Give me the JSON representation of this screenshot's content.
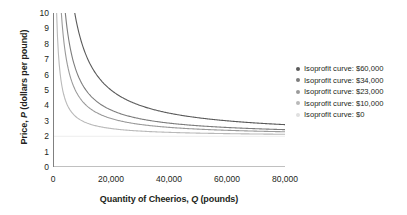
{
  "chart_data": {
    "type": "line",
    "title": "",
    "xlabel": "Quantity of Cheerios, Q (pounds)",
    "ylabel": "Price, P (dollars per pound)",
    "xlabel_parts": {
      "pre": "Quantity of Cheerios, ",
      "symbol": "Q",
      "post": " (pounds)"
    },
    "ylabel_parts": {
      "pre": "Price, ",
      "symbol": "P",
      "post": " (dollars per pound)"
    },
    "xlim": [
      0,
      80000
    ],
    "ylim": [
      0,
      10
    ],
    "xticks": [
      0,
      20000,
      40000,
      60000,
      80000
    ],
    "xtick_labels": [
      "0",
      "20,000",
      "40,000",
      "60,000",
      "80,000"
    ],
    "yticks": [
      0,
      1,
      2,
      3,
      4,
      5,
      6,
      7,
      8,
      9,
      10
    ],
    "ytick_labels": [
      "0",
      "1",
      "2",
      "3",
      "4",
      "5",
      "6",
      "7",
      "8",
      "9",
      "10"
    ],
    "grid": false,
    "legend_position": "right",
    "marginal_cost": 2,
    "curve_formula": "P = MC + profit / Q",
    "series": [
      {
        "name": "Isoprofit curve: $60,000",
        "profit": 60000,
        "color": "#5a5a5a",
        "points": [
          {
            "x": 7500,
            "y": 10.0
          },
          {
            "x": 8000,
            "y": 9.5
          },
          {
            "x": 8571,
            "y": 9.0
          },
          {
            "x": 10000,
            "y": 8.0
          },
          {
            "x": 12000,
            "y": 7.0
          },
          {
            "x": 15000,
            "y": 6.0
          },
          {
            "x": 20000,
            "y": 5.0
          },
          {
            "x": 24000,
            "y": 4.5
          },
          {
            "x": 30000,
            "y": 4.0
          },
          {
            "x": 40000,
            "y": 3.5
          },
          {
            "x": 60000,
            "y": 3.0
          },
          {
            "x": 80000,
            "y": 2.75
          }
        ]
      },
      {
        "name": "Isoprofit curve: $34,000",
        "profit": 34000,
        "color": "#7d7d7d",
        "points": [
          {
            "x": 4250,
            "y": 10.0
          },
          {
            "x": 4857,
            "y": 9.0
          },
          {
            "x": 5667,
            "y": 8.0
          },
          {
            "x": 6800,
            "y": 7.0
          },
          {
            "x": 8500,
            "y": 6.0
          },
          {
            "x": 11333,
            "y": 5.0
          },
          {
            "x": 17000,
            "y": 4.0
          },
          {
            "x": 22667,
            "y": 3.5
          },
          {
            "x": 34000,
            "y": 3.0
          },
          {
            "x": 56667,
            "y": 2.6
          },
          {
            "x": 80000,
            "y": 2.425
          }
        ]
      },
      {
        "name": "Isoprofit curve: $23,000",
        "profit": 23000,
        "color": "#9a9a9a",
        "points": [
          {
            "x": 2875,
            "y": 10.0
          },
          {
            "x": 3286,
            "y": 9.0
          },
          {
            "x": 3833,
            "y": 8.0
          },
          {
            "x": 4600,
            "y": 7.0
          },
          {
            "x": 5750,
            "y": 6.0
          },
          {
            "x": 7667,
            "y": 5.0
          },
          {
            "x": 11500,
            "y": 4.0
          },
          {
            "x": 15333,
            "y": 3.5
          },
          {
            "x": 23000,
            "y": 3.0
          },
          {
            "x": 46000,
            "y": 2.5
          },
          {
            "x": 80000,
            "y": 2.2875
          }
        ]
      },
      {
        "name": "Isoprofit curve: $10,000",
        "profit": 10000,
        "color": "#b9b9b9",
        "points": [
          {
            "x": 1250,
            "y": 10.0
          },
          {
            "x": 1429,
            "y": 9.0
          },
          {
            "x": 1667,
            "y": 8.0
          },
          {
            "x": 2000,
            "y": 7.0
          },
          {
            "x": 2500,
            "y": 6.0
          },
          {
            "x": 3333,
            "y": 5.0
          },
          {
            "x": 5000,
            "y": 4.0
          },
          {
            "x": 6667,
            "y": 3.5
          },
          {
            "x": 10000,
            "y": 3.0
          },
          {
            "x": 20000,
            "y": 2.5
          },
          {
            "x": 40000,
            "y": 2.25
          },
          {
            "x": 80000,
            "y": 2.125
          }
        ]
      },
      {
        "name": "Isoprofit curve: $0",
        "profit": 0,
        "color": "#ededed",
        "points": [
          {
            "x": 0,
            "y": 2.0
          },
          {
            "x": 80000,
            "y": 2.0
          }
        ]
      }
    ]
  },
  "legend": {
    "items": [
      {
        "label": "Isoprofit curve: $60,000",
        "color": "#5a5a5a"
      },
      {
        "label": "Isoprofit curve: $34,000",
        "color": "#7d7d7d"
      },
      {
        "label": "Isoprofit curve: $23,000",
        "color": "#9a9a9a"
      },
      {
        "label": "Isoprofit curve: $10,000",
        "color": "#b9b9b9"
      },
      {
        "label": "Isoprofit curve: $0",
        "color": "#e0e0e0"
      }
    ]
  },
  "axis": {
    "line_color": "#808080"
  }
}
